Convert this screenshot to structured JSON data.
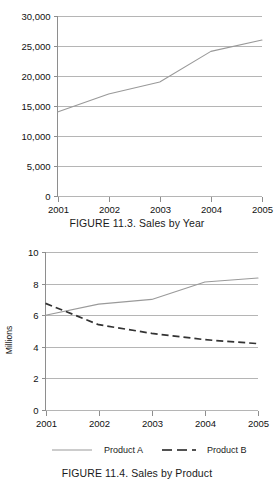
{
  "page": {
    "background_color": "#ffffff",
    "text_color": "#1a1a1a"
  },
  "figure1": {
    "caption": "FIGURE 11.3. Sales by Year",
    "chart_data": {
      "type": "line",
      "title": "",
      "xlabel": "",
      "ylabel": "",
      "categories": [
        "2001",
        "2002",
        "2003",
        "2004",
        "2005"
      ],
      "x": [
        2001,
        2002,
        2003,
        2004,
        2005
      ],
      "values": [
        14000,
        17000,
        19000,
        24100,
        26000
      ],
      "series": [
        {
          "name": "Sales",
          "values": [
            14000,
            17000,
            19000,
            24100,
            26000
          ],
          "color": "#999999",
          "style": "solid"
        }
      ],
      "ylim": [
        0,
        30000
      ],
      "xlim": [
        2001,
        2005
      ],
      "yticks": [
        0,
        5000,
        10000,
        15000,
        20000,
        25000,
        30000
      ],
      "ytick_labels": [
        "0",
        "5,000",
        "10,000",
        "15,000",
        "20,000",
        "25,000",
        "30,000"
      ],
      "xtick_labels": [
        "2001",
        "2002",
        "2003",
        "2004",
        "2005"
      ],
      "grid": true,
      "grid_axis": "y",
      "legend": false,
      "legend_position": "none"
    }
  },
  "figure2": {
    "caption": "FIGURE 11.4. Sales by Product",
    "chart_data": {
      "type": "line",
      "title": "",
      "xlabel": "",
      "ylabel": "Millions",
      "categories": [
        "2001",
        "2002",
        "2003",
        "2004",
        "2005"
      ],
      "x": [
        2001,
        2002,
        2003,
        2004,
        2005
      ],
      "series": [
        {
          "name": "Product A",
          "values": [
            6.0,
            6.7,
            7.0,
            8.1,
            8.35
          ],
          "color": "#9a9a9a",
          "style": "solid"
        },
        {
          "name": "Product B",
          "values": [
            6.75,
            5.4,
            4.85,
            4.45,
            4.2
          ],
          "color": "#333333",
          "style": "dashed"
        }
      ],
      "ylim": [
        0,
        10
      ],
      "xlim": [
        2001,
        2005
      ],
      "yticks": [
        0,
        2,
        4,
        6,
        8,
        10
      ],
      "ytick_labels": [
        "0",
        "2",
        "4",
        "6",
        "8",
        "10"
      ],
      "xtick_labels": [
        "2001",
        "2002",
        "2003",
        "2004",
        "2005"
      ],
      "grid": true,
      "grid_axis": "y",
      "legend": true,
      "legend_position": "bottom",
      "legend_entries": [
        "Product A",
        "Product B"
      ]
    }
  }
}
